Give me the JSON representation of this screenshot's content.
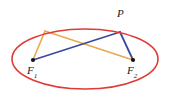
{
  "figure": {
    "type": "geometry-diagram",
    "width": 169,
    "height": 102,
    "background_color": "#ffffff",
    "colors": {
      "ellipse": "#e03a34",
      "segment_blue": "#3b4aa0",
      "segment_orange": "#e8a94f",
      "point": "#141414",
      "label_text": "#1a1a1a"
    },
    "ellipse": {
      "center_x": 85,
      "center_y": 59,
      "radius_x": 73,
      "radius_y": 30,
      "stroke_width": 1.6,
      "stroke_color": "#e03a34"
    },
    "points": [
      {
        "name": "P",
        "label": "P",
        "subscript": "",
        "x": 120,
        "y": 32,
        "dot": false,
        "label_x": 117,
        "label_y": 8
      },
      {
        "name": "F1",
        "label": "F",
        "subscript": "1",
        "x": 33,
        "y": 60,
        "dot": true,
        "label_x": 27,
        "label_y": 65
      },
      {
        "name": "F2",
        "label": "F",
        "subscript": "2",
        "x": 133,
        "y": 60,
        "dot": true,
        "label_x": 127,
        "label_y": 65
      },
      {
        "name": "Q",
        "label": "",
        "subscript": "",
        "x": 45,
        "y": 31,
        "dot": false,
        "label_x": 0,
        "label_y": 0
      }
    ],
    "segments": [
      {
        "name": "segment-P-F1",
        "from": "P",
        "to": "F1",
        "color": "#3b4aa0",
        "x1": 120,
        "y1": 32,
        "x2": 33,
        "y2": 60,
        "width": 1.8
      },
      {
        "name": "segment-P-F2",
        "from": "P",
        "to": "F2",
        "color": "#3b4aa0",
        "x1": 120,
        "y1": 32,
        "x2": 133,
        "y2": 60,
        "width": 1.8
      },
      {
        "name": "segment-Q-F1",
        "from": "Q",
        "to": "F1",
        "color": "#e8a94f",
        "x1": 45,
        "y1": 31,
        "x2": 33,
        "y2": 60,
        "width": 1.6
      },
      {
        "name": "segment-Q-F2",
        "from": "Q",
        "to": "F2",
        "color": "#e8a94f",
        "x1": 45,
        "y1": 31,
        "x2": 133,
        "y2": 60,
        "width": 1.6
      }
    ],
    "labels": {
      "p": "P",
      "f": "F",
      "f1_sub": "1",
      "f2_sub": "2"
    }
  }
}
